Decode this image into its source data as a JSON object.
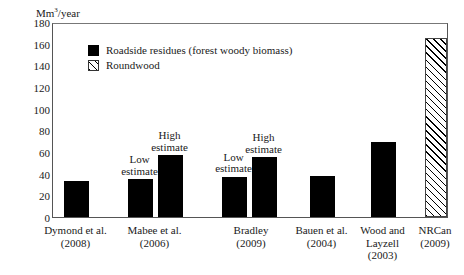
{
  "chart_data": {
    "type": "bar",
    "title": "",
    "xlabel": "",
    "ylabel": "Mm3/year",
    "ylabel_prefix": "Mm",
    "ylabel_sup": "3",
    "ylabel_suffix": "/year",
    "ylim": [
      0,
      180
    ],
    "ytick_values": [
      0,
      20,
      40,
      60,
      80,
      100,
      120,
      140,
      160,
      180
    ],
    "ytick_labels": [
      "0",
      "20",
      "40",
      "60",
      "80",
      "100",
      "120",
      "140",
      "160",
      "180"
    ],
    "grid": false,
    "legend_position": "upper-left-inside",
    "legend": [
      {
        "label": "Roadside residues (forest woody biomass)",
        "swatch": "solid-black"
      },
      {
        "label": "Roundwood",
        "swatch": "diagonal-hatch"
      }
    ],
    "categories": [
      "Dymond et al. (2008)",
      "Mabee et al. (2006)",
      "Bradley (2009)",
      "Bauen et al. (2004)",
      "Wood and Layzell (2003)",
      "NRCan (2009)"
    ],
    "bars": [
      {
        "group": "Dymond et al. (2008)",
        "value": 33,
        "series": "Roadside residues (forest woody biomass)",
        "annotation": "",
        "x": 63,
        "width": 25
      },
      {
        "group": "Mabee et al. (2006)",
        "value": 35,
        "series": "Roadside residues (forest woody biomass)",
        "annotation": "Low\nestimate",
        "x": 127,
        "width": 25
      },
      {
        "group": "Mabee et al. (2006)",
        "value": 57,
        "series": "Roadside residues (forest woody biomass)",
        "annotation": "High\nestimate",
        "x": 157,
        "width": 25
      },
      {
        "group": "Bradley (2009)",
        "value": 37,
        "series": "Roadside residues (forest woody biomass)",
        "annotation": "Low\nestimate",
        "x": 221,
        "width": 25
      },
      {
        "group": "Bradley (2009)",
        "value": 55,
        "series": "Roadside residues (forest woody biomass)",
        "annotation": "High\nestimate",
        "x": 251,
        "width": 25
      },
      {
        "group": "Bauen et al. (2004)",
        "value": 38,
        "series": "Roadside residues (forest woody biomass)",
        "annotation": "",
        "x": 309,
        "width": 25
      },
      {
        "group": "Wood and Layzell (2003)",
        "value": 69,
        "series": "Roadside residues (forest woody biomass)",
        "annotation": "",
        "x": 370,
        "width": 25
      },
      {
        "group": "NRCan (2009)",
        "value": 165,
        "series": "Roundwood",
        "annotation": "",
        "x": 424,
        "width": 22
      }
    ],
    "xtick_labels": [
      {
        "line1": "Dymond et al.",
        "line2": "(2008)",
        "line3": ""
      },
      {
        "line1": "Mabee et al.",
        "line2": "(2006)",
        "line3": ""
      },
      {
        "line1": "Bradley",
        "line2": "(2009)",
        "line3": ""
      },
      {
        "line1": "Bauen et al.",
        "line2": "(2004)",
        "line3": ""
      },
      {
        "line1": "Wood and",
        "line2": "Layzell",
        "line3": "(2003)"
      },
      {
        "line1": "NRCan",
        "line2": "(2009)",
        "line3": ""
      }
    ]
  }
}
